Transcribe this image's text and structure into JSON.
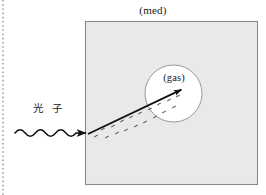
{
  "figure": {
    "title_label": "(med)",
    "inner_label": "(gas)",
    "photon_label": "光 子",
    "colors": {
      "medium_fill": "#e9e9e9",
      "medium_stroke": "#8a8a8a",
      "gas_fill": "#ffffff",
      "gas_stroke": "#999999",
      "track_stroke": "#111111",
      "wave_stroke": "#111111",
      "margin_rule": "#777777",
      "text": "#1a1a1a"
    },
    "medium_box": {
      "x": 85,
      "y": 21,
      "width": 173,
      "height": 164
    },
    "gas_circle": {
      "cx": 173.5,
      "cy": 93.5,
      "r": 28.5
    },
    "electron_track": {
      "x1": 88,
      "y1": 134,
      "x2": 185,
      "y2": 88
    },
    "photon_wave": {
      "x_start": 15,
      "x_end": 76,
      "y": 133,
      "cycles": 6,
      "amplitude": 4
    },
    "photon_arrow_tip": {
      "x": 88,
      "y": 133
    },
    "margin_rule_x": 3,
    "ionization_marks": [
      {
        "x": 96,
        "y": 136,
        "a": -28
      },
      {
        "x": 103,
        "y": 129,
        "a": -28
      },
      {
        "x": 107,
        "y": 137,
        "a": -28
      },
      {
        "x": 113,
        "y": 126,
        "a": -28
      },
      {
        "x": 117,
        "y": 133,
        "a": -28
      },
      {
        "x": 122,
        "y": 121,
        "a": -28
      },
      {
        "x": 126,
        "y": 130,
        "a": -28
      },
      {
        "x": 131,
        "y": 117,
        "a": -28
      },
      {
        "x": 136,
        "y": 126,
        "a": -28
      },
      {
        "x": 140,
        "y": 113,
        "a": -28
      },
      {
        "x": 145,
        "y": 122,
        "a": -28
      },
      {
        "x": 150,
        "y": 109,
        "a": -28
      },
      {
        "x": 155,
        "y": 117,
        "a": -28
      },
      {
        "x": 159,
        "y": 104,
        "a": -28
      },
      {
        "x": 164,
        "y": 112,
        "a": -28
      },
      {
        "x": 169,
        "y": 100,
        "a": -28
      },
      {
        "x": 174,
        "y": 107,
        "a": -28
      },
      {
        "x": 178,
        "y": 96,
        "a": -28
      }
    ]
  }
}
